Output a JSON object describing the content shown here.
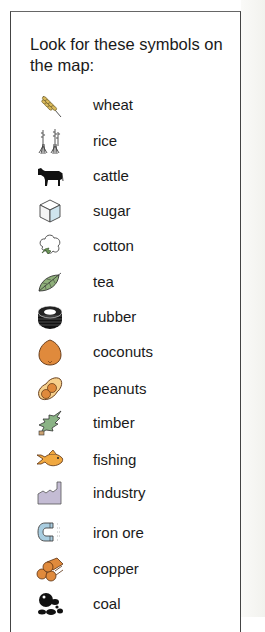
{
  "legend": {
    "title": "Look for these symbols on the map:",
    "items": [
      {
        "label": "wheat",
        "icon": "wheat-icon"
      },
      {
        "label": "rice",
        "icon": "rice-icon"
      },
      {
        "label": "cattle",
        "icon": "cattle-icon"
      },
      {
        "label": "sugar",
        "icon": "sugar-cube-icon"
      },
      {
        "label": "cotton",
        "icon": "cotton-icon"
      },
      {
        "label": "tea",
        "icon": "tea-leaf-icon"
      },
      {
        "label": "rubber",
        "icon": "tire-icon"
      },
      {
        "label": "coconuts",
        "icon": "coconut-icon"
      },
      {
        "label": "peanuts",
        "icon": "peanut-icon"
      },
      {
        "label": "timber",
        "icon": "tree-icon"
      },
      {
        "label": "fishing",
        "icon": "fish-icon"
      },
      {
        "label": "industry",
        "icon": "factory-icon"
      },
      {
        "label": "iron ore",
        "icon": "magnet-icon"
      },
      {
        "label": "copper",
        "icon": "copper-logs-icon"
      },
      {
        "label": "coal",
        "icon": "coal-lumps-icon"
      }
    ]
  },
  "colors": {
    "wheat": "#c9a94a",
    "coconut": "#e08a3c",
    "peanut": "#e9a050",
    "tea": "#8fb07a",
    "timber": "#7fa87a",
    "fish": "#f0a840",
    "industry": "#b8aec8",
    "iron": "#a9cde0",
    "copper": "#e08a3c",
    "sugar": "#cfe4ee"
  }
}
